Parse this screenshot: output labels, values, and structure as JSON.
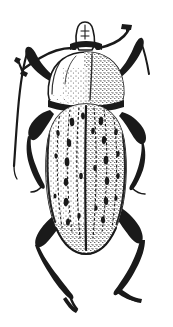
{
  "figure": {
    "title": "Beetle dorsal view line illustration",
    "subject_common_name": "Beetle",
    "view": "dorsal",
    "technique": "stippled pen-and-ink line drawing",
    "background_color": "#ffffff",
    "ink_color": "#1a1a1a",
    "canvas": {
      "width": 173,
      "height": 327
    }
  },
  "anatomy": {
    "parts": [
      {
        "id": "head",
        "label": "Head",
        "note": "small, narrow, projecting rostrum at top center"
      },
      {
        "id": "rostrum",
        "label": "Rostrum",
        "note": "short snout directed upward"
      },
      {
        "id": "eye-left",
        "label": "Left eye",
        "note": "dark spot at base of rostrum"
      },
      {
        "id": "eye-right",
        "label": "Right eye",
        "note": "dark spot at base of rostrum"
      },
      {
        "id": "antenna-left",
        "label": "Left antenna",
        "note": "sweeps up and to the left, clubbed tip"
      },
      {
        "id": "antenna-right",
        "label": "Right antenna",
        "note": "sweeps up and to the right, clubbed tip"
      },
      {
        "id": "pronotum",
        "label": "Pronotum",
        "note": "broad rounded shield, densely stippled on right half"
      },
      {
        "id": "elytra",
        "label": "Elytra",
        "note": "long oval wing covers with longitudinal striae and rows of dark spots"
      },
      {
        "id": "elytral-suture",
        "label": "Elytral suture",
        "note": "central dividing line between the two elytra"
      },
      {
        "id": "leg-fore-left",
        "label": "Left foreleg"
      },
      {
        "id": "leg-fore-right",
        "label": "Right foreleg"
      },
      {
        "id": "leg-mid-left",
        "label": "Left midleg"
      },
      {
        "id": "leg-mid-right",
        "label": "Right midleg"
      },
      {
        "id": "leg-hind-left",
        "label": "Left hindleg"
      },
      {
        "id": "leg-hind-right",
        "label": "Right hindleg"
      }
    ],
    "counts": {
      "legs_visible": 6,
      "antennae_visible": 2,
      "elytra": 2,
      "spot_rows_per_elytron": 3
    }
  },
  "pattern": {
    "description": "Rows of elongate black maculae arranged along the striae of each elytron over a fine stippled ground",
    "left_elytron_spots": [
      {
        "x": 72,
        "y": 122,
        "rx": 2.3,
        "ry": 4.2,
        "rot": -4
      },
      {
        "x": 69,
        "y": 143,
        "rx": 2.2,
        "ry": 4.0,
        "rot": -3
      },
      {
        "x": 67,
        "y": 162,
        "rx": 2.4,
        "ry": 4.4,
        "rot": -2
      },
      {
        "x": 66,
        "y": 182,
        "rx": 2.2,
        "ry": 4.0,
        "rot": 0
      },
      {
        "x": 66,
        "y": 202,
        "rx": 2.3,
        "ry": 4.2,
        "rot": 2
      },
      {
        "x": 68,
        "y": 222,
        "rx": 2.0,
        "ry": 3.6,
        "rot": 3
      },
      {
        "x": 58,
        "y": 133,
        "rx": 1.7,
        "ry": 3.0,
        "rot": -6
      },
      {
        "x": 56,
        "y": 156,
        "rx": 1.6,
        "ry": 2.8,
        "rot": -4
      },
      {
        "x": 55,
        "y": 196,
        "rx": 1.5,
        "ry": 2.6,
        "rot": 0
      },
      {
        "x": 83,
        "y": 116,
        "rx": 1.9,
        "ry": 3.4,
        "rot": -5
      },
      {
        "x": 81,
        "y": 176,
        "rx": 1.8,
        "ry": 3.2,
        "rot": 0
      },
      {
        "x": 79,
        "y": 216,
        "rx": 1.7,
        "ry": 3.0,
        "rot": 2
      }
    ],
    "right_elytron_spots": [
      {
        "x": 101,
        "y": 121,
        "rx": 2.3,
        "ry": 4.2,
        "rot": 4
      },
      {
        "x": 104,
        "y": 140,
        "rx": 2.2,
        "ry": 4.0,
        "rot": 3
      },
      {
        "x": 106,
        "y": 160,
        "rx": 2.4,
        "ry": 4.3,
        "rot": 2
      },
      {
        "x": 107,
        "y": 181,
        "rx": 2.2,
        "ry": 4.0,
        "rot": 0
      },
      {
        "x": 106,
        "y": 201,
        "rx": 2.2,
        "ry": 3.9,
        "rot": -2
      },
      {
        "x": 103,
        "y": 220,
        "rx": 2.0,
        "ry": 3.5,
        "rot": -3
      },
      {
        "x": 116,
        "y": 132,
        "rx": 1.8,
        "ry": 3.2,
        "rot": 6
      },
      {
        "x": 118,
        "y": 154,
        "rx": 1.7,
        "ry": 3.0,
        "rot": 4
      },
      {
        "x": 118,
        "y": 176,
        "rx": 1.7,
        "ry": 3.0,
        "rot": 2
      },
      {
        "x": 116,
        "y": 198,
        "rx": 1.6,
        "ry": 2.8,
        "rot": 0
      },
      {
        "x": 93,
        "y": 131,
        "rx": 1.8,
        "ry": 3.2,
        "rot": 3
      },
      {
        "x": 95,
        "y": 168,
        "rx": 1.7,
        "ry": 3.0,
        "rot": 0
      },
      {
        "x": 96,
        "y": 208,
        "rx": 1.6,
        "ry": 2.8,
        "rot": 0
      }
    ]
  },
  "palette": {
    "ink": "#1a1a1a",
    "paper": "#ffffff",
    "stipple": "#1a1a1a"
  }
}
